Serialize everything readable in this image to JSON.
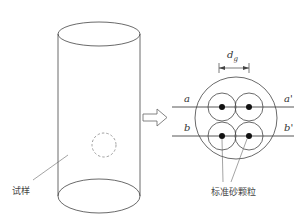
{
  "diagram": {
    "specimen": {
      "label": "试样",
      "shape": "cylinder"
    },
    "arrow": {
      "type": "hollow-right-arrow"
    },
    "cross_section": {
      "dimension_label": "d",
      "dimension_subscript": "g",
      "line_labels": {
        "a": "a",
        "a_prime": "a'",
        "b": "b",
        "b_prime": "b'"
      },
      "particles_label": "标准砂颗粒",
      "particle_count": 4
    },
    "colors": {
      "stroke": "#444444",
      "dashed": "#888888",
      "fill_dot": "#111111"
    }
  }
}
